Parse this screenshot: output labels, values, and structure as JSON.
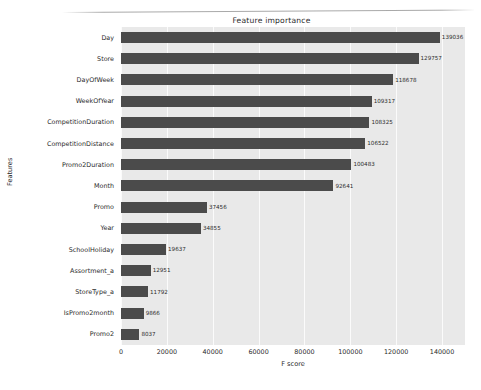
{
  "chart_data": {
    "type": "bar",
    "orientation": "horizontal",
    "title": "Feature importance",
    "xlabel": "F score",
    "ylabel": "Features",
    "xlim": [
      0,
      150000
    ],
    "xticks": [
      "0",
      "20000",
      "40000",
      "60000",
      "80000",
      "100000",
      "120000",
      "140000"
    ],
    "xtick_values": [
      0,
      20000,
      40000,
      60000,
      80000,
      100000,
      120000,
      140000
    ],
    "grid": true,
    "legend": null,
    "categories": [
      "Day",
      "Store",
      "DayOfWeek",
      "WeekOfYear",
      "CompetitionDuration",
      "CompetitionDistance",
      "Promo2Duration",
      "Month",
      "Promo",
      "Year",
      "SchoolHoliday",
      "Assortment_a",
      "StoreType_a",
      "IsPromo2month",
      "Promo2"
    ],
    "values": [
      139036,
      129757,
      118678,
      109317,
      108325,
      106522,
      100483,
      92641,
      37456,
      34855,
      19637,
      12951,
      11792,
      9866,
      8037
    ],
    "value_labels": [
      "139036",
      "129757",
      "118678",
      "109317",
      "108325",
      "106522",
      "100483",
      "92641",
      "37456",
      "34855",
      "19637",
      "12951",
      "11792",
      "9866",
      "8037"
    ],
    "colors": {
      "bar": "#4b4b4b",
      "plot_background": "#e9e9e9",
      "grid": "#fbfbfb",
      "figure_background": "#ffffff",
      "text": "#2b2b2b"
    }
  }
}
